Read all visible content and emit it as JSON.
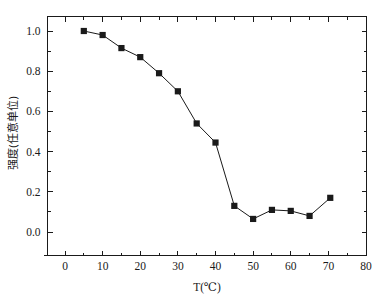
{
  "chart_data": {
    "type": "line",
    "title": "",
    "subtitle": "",
    "xlabel": "T(℃)",
    "ylabel": "强度(任意单位)",
    "xlim": [
      0,
      80
    ],
    "ylim": [
      0.0,
      1.0
    ],
    "x_major_ticks": [
      0,
      10,
      20,
      30,
      40,
      50,
      60,
      70,
      80
    ],
    "x_tick_labels": [
      "0",
      "10",
      "20",
      "30",
      "40",
      "50",
      "60",
      "70",
      "80"
    ],
    "x_minor_interval": 5,
    "y_major_ticks": [
      0.0,
      0.2,
      0.4,
      0.6,
      0.8,
      1.0
    ],
    "y_tick_labels": [
      "0.0",
      "0.2",
      "0.4",
      "0.6",
      "0.8",
      "1.0"
    ],
    "y_minor_interval": 0.1,
    "grid": false,
    "legend": false,
    "legend_position": "none",
    "marker": "square",
    "marker_color": "#1a1a1a",
    "line_color": "#1a1a1a",
    "background_color": "#ffffff",
    "frame_color": "#1a1a1a",
    "x": [
      5,
      10,
      15,
      20,
      25,
      30,
      35,
      40,
      45,
      50,
      55,
      60,
      65,
      70.5
    ],
    "values": [
      1.0,
      0.98,
      0.915,
      0.87,
      0.79,
      0.7,
      0.54,
      0.445,
      0.13,
      0.065,
      0.11,
      0.105,
      0.08,
      0.17
    ],
    "series": [
      {
        "name": "强度",
        "x": [
          5,
          10,
          15,
          20,
          25,
          30,
          35,
          40,
          45,
          50,
          55,
          60,
          65,
          70.5
        ],
        "values": [
          1.0,
          0.98,
          0.915,
          0.87,
          0.79,
          0.7,
          0.54,
          0.445,
          0.13,
          0.065,
          0.11,
          0.105,
          0.08,
          0.17
        ]
      }
    ],
    "annotations": []
  }
}
